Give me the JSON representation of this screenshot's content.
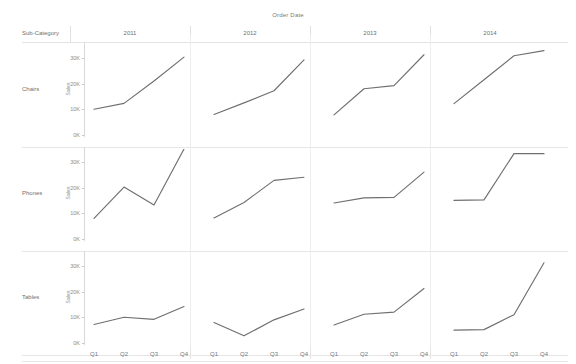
{
  "header": {
    "order_date_title": "Order Date",
    "sub_category_label": "Sub-Category",
    "years": [
      "2011",
      "2012",
      "2013",
      "2014"
    ]
  },
  "axis": {
    "sales_title": "Sales",
    "y_ticks": [
      "30K",
      "20K",
      "10K",
      "0K"
    ],
    "quarters": [
      "Q1",
      "Q2",
      "Q3",
      "Q4"
    ]
  },
  "rows": [
    {
      "label": "Chairs"
    },
    {
      "label": "Phones"
    },
    {
      "label": "Tables"
    }
  ],
  "colors": {
    "line": "#6d6f72",
    "grid": "#e6e6e6",
    "text": "#77787a",
    "background": "#ffffff"
  },
  "chart_data": {
    "type": "line",
    "title": "Order Date",
    "xlabel": "",
    "ylabel": "Sales",
    "ylim": [
      0,
      35000
    ],
    "yticks": [
      0,
      10000,
      20000,
      30000
    ],
    "ytick_labels": [
      "0K",
      "10K",
      "20K",
      "30K"
    ],
    "grid": false,
    "legend": "none",
    "layout": "trellis/small-multiples, rows = Sub-Category, columns = Order Date (Year)",
    "row_field": "Sub-Category",
    "column_field": "Order Date",
    "rows": [
      "Chairs",
      "Phones",
      "Tables"
    ],
    "columns": [
      "2011",
      "2012",
      "2013",
      "2014"
    ],
    "categories": [
      "Q1",
      "Q2",
      "Q3",
      "Q4"
    ],
    "panels": [
      {
        "row": "Chairs",
        "column": "2011",
        "values": [
          10000,
          12300,
          21000,
          30300
        ]
      },
      {
        "row": "Chairs",
        "column": "2012",
        "values": [
          8000,
          12500,
          17200,
          29200
        ]
      },
      {
        "row": "Chairs",
        "column": "2013",
        "values": [
          7800,
          18000,
          19200,
          31200
        ]
      },
      {
        "row": "Chairs",
        "column": "2014",
        "values": [
          12200,
          21500,
          30800,
          32800
        ]
      },
      {
        "row": "Phones",
        "column": "2011",
        "values": [
          8000,
          20200,
          13200,
          35000
        ]
      },
      {
        "row": "Phones",
        "column": "2012",
        "values": [
          8200,
          14200,
          22800,
          24000
        ]
      },
      {
        "row": "Phones",
        "column": "2013",
        "values": [
          14000,
          16000,
          16200,
          26000
        ]
      },
      {
        "row": "Phones",
        "column": "2014",
        "values": [
          15000,
          15200,
          33200,
          33200
        ]
      },
      {
        "row": "Tables",
        "column": "2011",
        "values": [
          7200,
          10000,
          9200,
          14200
        ]
      },
      {
        "row": "Tables",
        "column": "2012",
        "values": [
          8000,
          2800,
          9000,
          13200
        ]
      },
      {
        "row": "Tables",
        "column": "2013",
        "values": [
          7000,
          11200,
          12000,
          21200
        ]
      },
      {
        "row": "Tables",
        "column": "2014",
        "values": [
          5000,
          5200,
          11000,
          31200
        ]
      }
    ]
  }
}
